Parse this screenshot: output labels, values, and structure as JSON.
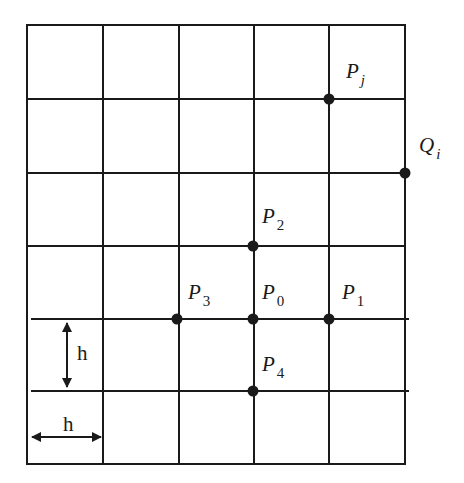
{
  "diagram": {
    "title": "",
    "grid": {
      "columns": 5,
      "rows": 6,
      "x_lines": [
        27,
        103,
        179,
        254,
        329,
        405
      ],
      "y_lines": [
        25,
        99,
        173,
        246,
        319,
        391,
        464
      ],
      "line_color": "#1a1a1a"
    },
    "points": [
      {
        "id": "Pj",
        "label": "P",
        "sub": "j",
        "sub_italic": true,
        "x": 329,
        "y": 99,
        "label_x": 346,
        "label_y": 61
      },
      {
        "id": "Qi",
        "label": "Q",
        "sub": "i",
        "sub_italic": true,
        "x": 405,
        "y": 173,
        "label_x": 419,
        "label_y": 135
      },
      {
        "id": "P2",
        "label": "P",
        "sub": "2",
        "sub_italic": false,
        "x": 253,
        "y": 246,
        "label_x": 262,
        "label_y": 206
      },
      {
        "id": "P3",
        "label": "P",
        "sub": "3",
        "sub_italic": false,
        "x": 177,
        "y": 319,
        "label_x": 188,
        "label_y": 282
      },
      {
        "id": "P0",
        "label": "P",
        "sub": "0",
        "sub_italic": false,
        "x": 253,
        "y": 319,
        "label_x": 262,
        "label_y": 282
      },
      {
        "id": "P1",
        "label": "P",
        "sub": "1",
        "sub_italic": false,
        "x": 329,
        "y": 319,
        "label_x": 342,
        "label_y": 282
      },
      {
        "id": "P4",
        "label": "P",
        "sub": "4",
        "sub_italic": false,
        "x": 253,
        "y": 391,
        "label_x": 262,
        "label_y": 354
      }
    ],
    "spacing_labels": {
      "vertical": "h",
      "horizontal": "h"
    }
  }
}
